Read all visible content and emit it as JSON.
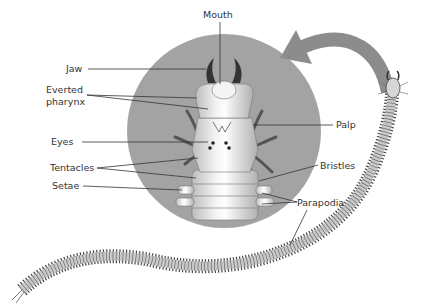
{
  "diagram": {
    "labels": {
      "mouth": "Mouth",
      "jaw": "Jaw",
      "everted_pharynx_line1": "Everted",
      "everted_pharynx_line2": "pharynx",
      "eyes": "Eyes",
      "tentacles": "Tentacles",
      "setae": "Setae",
      "palp": "Palp",
      "bristles": "Bristles",
      "parapodia": "Parapodia"
    },
    "colors": {
      "circle": "#a3a3a3",
      "arrow": "#8a8a8a",
      "body": "#c8c8c8",
      "lines": "#333333"
    }
  }
}
